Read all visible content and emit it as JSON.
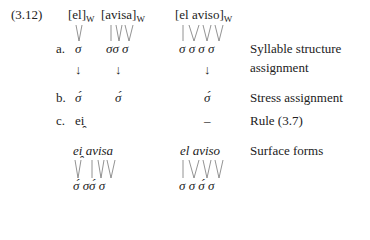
{
  "example_number": "(3.12)",
  "inputs": [
    {
      "text": "[el]",
      "subscript": "W"
    },
    {
      "text": "[avisa]",
      "subscript": "W"
    },
    {
      "text": "[el aviso]",
      "subscript": "W"
    }
  ],
  "rows": {
    "a": {
      "label": "a.",
      "col1": "σ",
      "col2": "σσ σ",
      "col3": "σ σ σ σ",
      "description_line1": "Syllable structure",
      "description_line2": "assignment"
    },
    "arrows": {
      "col1": "↓",
      "col2": "↓",
      "col3": "↓"
    },
    "b": {
      "label": "b.",
      "col1": "σ́",
      "col2": "σ́",
      "col3": "σ́",
      "description": "Stress assignment"
    },
    "c": {
      "label": "c.",
      "col1": "ei̯",
      "col3": "–",
      "description": "Rule (3.7)"
    }
  },
  "surface": {
    "form1": "ei̯ avisa",
    "form2": "el aviso",
    "description": "Surface forms",
    "sigmas1": "σ́ σσ́ σ",
    "sigmas2": "σ σ σ́ σ"
  }
}
